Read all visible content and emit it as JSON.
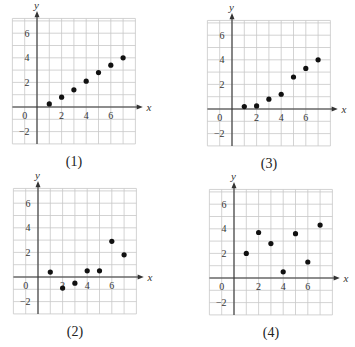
{
  "chart_data": [
    {
      "type": "scatter",
      "title": "(1)",
      "xlabel": "x",
      "ylabel": "y",
      "xlim": [
        -2,
        8
      ],
      "ylim": [
        -3,
        7
      ],
      "xticks": [
        0,
        2,
        4,
        6
      ],
      "yticks": [
        -2,
        2,
        4,
        6
      ],
      "grid": true,
      "x": [
        1,
        2,
        3,
        4,
        5,
        6,
        7
      ],
      "y": [
        0.25,
        0.8,
        1.4,
        2.1,
        2.8,
        3.4,
        4.0
      ]
    },
    {
      "type": "scatter",
      "title": "(2)",
      "xlabel": "x",
      "ylabel": "y",
      "xlim": [
        -2,
        8
      ],
      "ylim": [
        -3,
        7
      ],
      "xticks": [
        0,
        2,
        4,
        6
      ],
      "yticks": [
        -2,
        2,
        4,
        6
      ],
      "grid": true,
      "x": [
        1,
        2,
        3,
        4,
        5,
        6,
        7
      ],
      "y": [
        0.4,
        -0.9,
        -0.5,
        0.5,
        0.5,
        2.9,
        1.8
      ]
    },
    {
      "type": "scatter",
      "title": "(3)",
      "xlabel": "x",
      "ylabel": "y",
      "xlim": [
        -2,
        8
      ],
      "ylim": [
        -3,
        7
      ],
      "xticks": [
        0,
        2,
        4,
        6
      ],
      "yticks": [
        -2,
        2,
        4,
        6
      ],
      "grid": true,
      "x": [
        1,
        2,
        3,
        4,
        5,
        6,
        7
      ],
      "y": [
        0.2,
        0.25,
        0.8,
        1.2,
        2.6,
        3.3,
        4.0
      ]
    },
    {
      "type": "scatter",
      "title": "(4)",
      "xlabel": "x",
      "ylabel": "y",
      "xlim": [
        -2,
        8
      ],
      "ylim": [
        -3,
        7
      ],
      "xticks": [
        0,
        2,
        4,
        6
      ],
      "yticks": [
        -2,
        2,
        4,
        6
      ],
      "grid": true,
      "x": [
        1,
        2,
        3,
        4,
        5,
        6,
        7
      ],
      "y": [
        2.0,
        3.7,
        2.8,
        0.5,
        3.6,
        1.3,
        4.3
      ]
    }
  ],
  "panels": [
    {
      "caption": "(1)",
      "origin": [
        37,
        107
      ]
    },
    {
      "caption": "(2)",
      "origin": [
        38,
        277
      ]
    },
    {
      "caption": "(3)",
      "origin": [
        232,
        109
      ]
    },
    {
      "caption": "(4)",
      "origin": [
        234,
        278
      ]
    }
  ],
  "colors": {
    "grid": "#c8c8c8",
    "axis": "#333333",
    "point": "#111111"
  }
}
